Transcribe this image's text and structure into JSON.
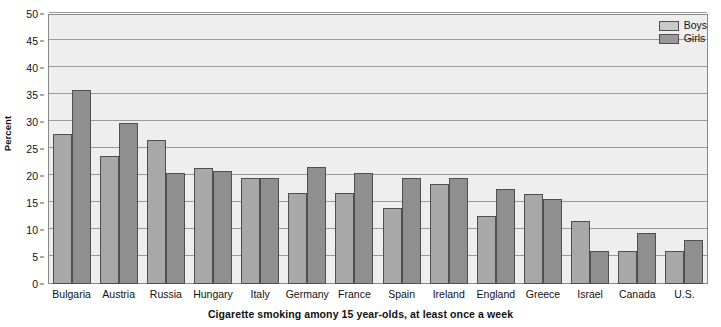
{
  "chart_data": {
    "type": "bar",
    "title": "",
    "xlabel": "Cigarette smoking amony 15 year-olds, at least once a week",
    "ylabel": "Percent",
    "ylim": [
      0,
      50
    ],
    "ytick_step": 5,
    "yticks": [
      0,
      5,
      10,
      15,
      20,
      25,
      30,
      35,
      40,
      45,
      50
    ],
    "grid": true,
    "legend_position": "top-right",
    "categories": [
      "Bulgaria",
      "Austria",
      "Russia",
      "Hungary",
      "Italy",
      "Germany",
      "France",
      "Spain",
      "Ireland",
      "England",
      "Greece",
      "Israel",
      "Canada",
      "U.S."
    ],
    "series": [
      {
        "name": "Boys",
        "color": "#a8a8a8",
        "values": [
          27.8,
          23.7,
          26.6,
          21.5,
          19.7,
          16.8,
          16.8,
          14.0,
          18.5,
          12.6,
          16.7,
          11.6,
          6.2,
          6.1
        ]
      },
      {
        "name": "Girls",
        "color": "#8f8f8f",
        "values": [
          35.9,
          29.8,
          20.6,
          21.0,
          19.7,
          21.6,
          20.5,
          19.6,
          19.6,
          17.6,
          15.7,
          6.2,
          9.4,
          8.1
        ]
      }
    ]
  },
  "legend": {
    "items": [
      {
        "label": "Boys",
        "swatch": "boys"
      },
      {
        "label": "Girls",
        "swatch": "girls"
      }
    ]
  }
}
